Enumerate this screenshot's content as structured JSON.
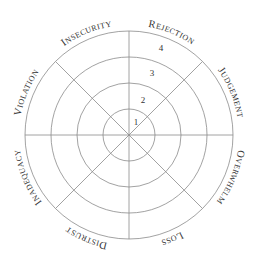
{
  "diagram": {
    "type": "radial-wheel",
    "center": [
      129,
      135
    ],
    "ring_radii": [
      26,
      52,
      78,
      104
    ],
    "spoke_angles_deg": [
      0,
      45,
      90,
      135,
      180,
      225,
      270,
      315
    ],
    "line_color": "#8a8a8a",
    "text_color": "#333333",
    "ring_numbers": [
      "1",
      "2",
      "3",
      "4"
    ],
    "segments": [
      {
        "label": "Rejection",
        "first": "R",
        "rest": "EJECTION",
        "angle": 22.5
      },
      {
        "label": "Judgement",
        "first": "J",
        "rest": "UDGEMENT",
        "angle": 67.5
      },
      {
        "label": "Overwhelm",
        "first": "O",
        "rest": "VERWHELM",
        "angle": 112.5
      },
      {
        "label": "Loss",
        "first": "L",
        "rest": "OSS",
        "angle": 157.5
      },
      {
        "label": "Distrust",
        "first": "D",
        "rest": "ISTRUST",
        "angle": 202.5
      },
      {
        "label": "Inadequacy",
        "first": "I",
        "rest": "NADEQUACY",
        "angle": 247.5
      },
      {
        "label": "Violation",
        "first": "V",
        "rest": "IOLATION",
        "angle": 292.5
      },
      {
        "label": "Insecurity",
        "first": "I",
        "rest": "NSECURITY",
        "angle": 337.5
      }
    ]
  }
}
